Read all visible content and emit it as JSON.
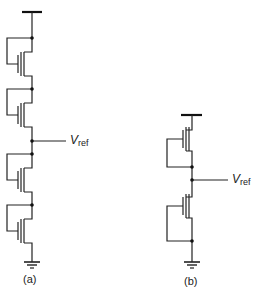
{
  "figure": {
    "panels": [
      {
        "id": "a",
        "caption": "(a)",
        "description": "Four diode-connected NMOS transistors stacked between supply and ground; reference voltage taken from the midpoint",
        "transistor_count": 4,
        "output_label": {
          "main": "V",
          "sub": "ref"
        }
      },
      {
        "id": "b",
        "caption": "(b)",
        "description": "Two diode-connected PMOS transistors stacked between supply and ground; reference voltage taken from the midpoint",
        "transistor_count": 2,
        "output_label": {
          "main": "V",
          "sub": "ref"
        }
      }
    ]
  }
}
